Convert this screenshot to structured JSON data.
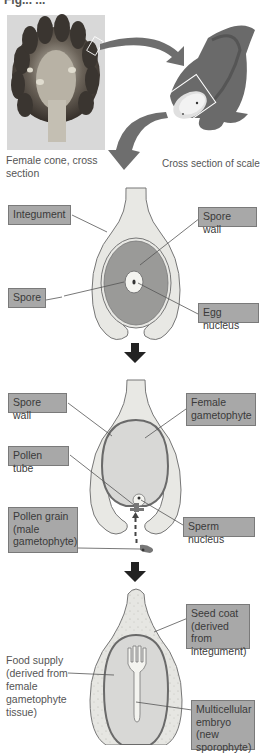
{
  "figure": {
    "heading_partial": "Fig... ...",
    "top_panel": {
      "cone_caption": "Female cone, cross section",
      "scale_caption": "Cross section of scale"
    },
    "stage1": {
      "labels": {
        "integument": "Integument",
        "spore_wall": "Spore wall",
        "spore": "Spore",
        "egg_nucleus": "Egg nucleus"
      }
    },
    "stage2": {
      "labels": {
        "spore_wall": "Spore wall",
        "female_gametophyte": "Female gametophyte",
        "pollen_tube": "Pollen tube",
        "pollen_grain": "Pollen grain (male gametophyte)",
        "sperm_nucleus": "Sperm nucleus"
      }
    },
    "stage3": {
      "labels": {
        "seed_coat": "Seed coat (derived from integument)",
        "food_supply": "Food supply (derived from female gametophyte tissue)",
        "embryo": "Multicellular embryo (new sporophyte)"
      }
    },
    "colors": {
      "label_fill": "#a8a8a8",
      "integument_fill": "#e8e8e4",
      "megasporangium_fill": "#9a9a98",
      "gametophyte_fill": "#d8d8d6",
      "arrow_fill": "#6e6e6e",
      "step_arrow": "#222222",
      "outline": "#777777"
    }
  }
}
